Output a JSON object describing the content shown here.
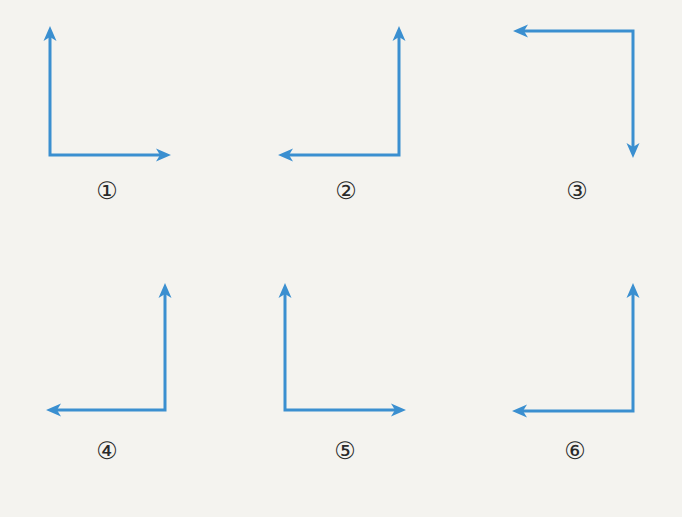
{
  "diagram": {
    "background": "#f4f3ef",
    "arrow_color": "#3a8fd0",
    "stroke_width": 3,
    "figures": [
      {
        "label": "①",
        "corner": [
          50,
          155
        ],
        "vertical_tip": [
          50,
          26
        ],
        "horizontal_tip": [
          171,
          155
        ],
        "vertical_direction": "up",
        "horizontal_direction": "right",
        "label_pos": [
          107,
          191
        ]
      },
      {
        "label": "②",
        "corner": [
          399,
          155
        ],
        "vertical_tip": [
          399,
          26
        ],
        "horizontal_tip": [
          278,
          155
        ],
        "vertical_direction": "up",
        "horizontal_direction": "left",
        "label_pos": [
          346,
          191
        ]
      },
      {
        "label": "③",
        "corner": [
          633,
          31
        ],
        "vertical_tip": [
          633,
          158
        ],
        "horizontal_tip": [
          513,
          31
        ],
        "vertical_direction": "down",
        "horizontal_direction": "left",
        "label_pos": [
          577,
          191
        ]
      },
      {
        "label": "④",
        "corner": [
          165,
          410
        ],
        "vertical_tip": [
          165,
          283
        ],
        "horizontal_tip": [
          46,
          410
        ],
        "vertical_direction": "up",
        "horizontal_direction": "left",
        "label_pos": [
          107,
          451
        ]
      },
      {
        "label": "⑤",
        "corner": [
          285,
          410
        ],
        "vertical_tip": [
          285,
          283
        ],
        "horizontal_tip": [
          406,
          410
        ],
        "vertical_direction": "up",
        "horizontal_direction": "right",
        "label_pos": [
          345,
          451
        ]
      },
      {
        "label": "⑥",
        "corner": [
          633,
          411
        ],
        "vertical_tip": [
          633,
          283
        ],
        "horizontal_tip": [
          512,
          411
        ],
        "vertical_direction": "up",
        "horizontal_direction": "left",
        "label_pos": [
          575,
          451
        ]
      }
    ]
  }
}
